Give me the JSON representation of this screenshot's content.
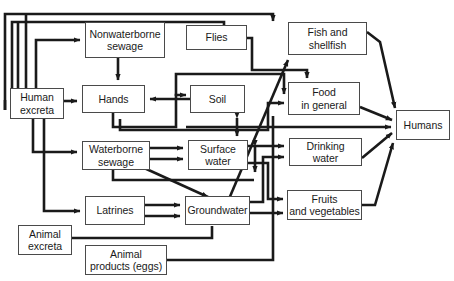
{
  "diagram": {
    "type": "flow-diagram",
    "stroke_color": "#1a1a1a",
    "box_border_color": "#4a4a4a",
    "background_color": "#ffffff",
    "nodes": [
      {
        "id": "human-excreta",
        "label": "Human\nexcreta",
        "x": 10,
        "y": 88,
        "w": 54,
        "h": 31
      },
      {
        "id": "nonwaterborne",
        "label": "Nonwaterborne\nsewage",
        "x": 85,
        "y": 22,
        "w": 80,
        "h": 36
      },
      {
        "id": "flies",
        "label": "Flies",
        "x": 186,
        "y": 25,
        "w": 61,
        "h": 25
      },
      {
        "id": "fish-shellfish",
        "label": "Fish and\nshellfish",
        "x": 288,
        "y": 22,
        "w": 79,
        "h": 33
      },
      {
        "id": "hands",
        "label": "Hands",
        "x": 82,
        "y": 85,
        "w": 63,
        "h": 28
      },
      {
        "id": "soil",
        "label": "Soil",
        "x": 190,
        "y": 85,
        "w": 55,
        "h": 28
      },
      {
        "id": "food-in-general",
        "label": "Food\nin general",
        "x": 288,
        "y": 82,
        "w": 72,
        "h": 33
      },
      {
        "id": "humans",
        "label": "Humans",
        "x": 396,
        "y": 110,
        "w": 54,
        "h": 30
      },
      {
        "id": "waterborne",
        "label": "Waterborne\nsewage",
        "x": 82,
        "y": 141,
        "w": 68,
        "h": 29
      },
      {
        "id": "surface-water",
        "label": "Surface\nwater",
        "x": 188,
        "y": 140,
        "w": 60,
        "h": 30
      },
      {
        "id": "drinking-water",
        "label": "Drinking\nwater",
        "x": 289,
        "y": 138,
        "w": 73,
        "h": 28
      },
      {
        "id": "latrines",
        "label": "Latrines",
        "x": 85,
        "y": 196,
        "w": 60,
        "h": 29
      },
      {
        "id": "groundwater",
        "label": "Groundwater",
        "x": 185,
        "y": 196,
        "w": 65,
        "h": 29
      },
      {
        "id": "fruits-vegetables",
        "label": "Fruits\nand vegetables",
        "x": 287,
        "y": 190,
        "w": 75,
        "h": 30
      },
      {
        "id": "animal-excreta",
        "label": "Animal\nexcreta",
        "x": 18,
        "y": 225,
        "w": 54,
        "h": 30
      },
      {
        "id": "animal-products",
        "label": "Animal\nproducts (eggs)",
        "x": 85,
        "y": 245,
        "w": 82,
        "h": 30
      }
    ],
    "edges": [
      {
        "id": "e-humans-to-humanexcreta-outer",
        "from": "humans",
        "to": "human-excreta",
        "label": ""
      },
      {
        "id": "e-humans-to-humanexcreta-inner",
        "from": "humans",
        "to": "human-excreta",
        "label": ""
      },
      {
        "id": "e-humanexcreta-nonwaterborne",
        "from": "human-excreta",
        "to": "nonwaterborne",
        "label": ""
      },
      {
        "id": "e-humanexcreta-hands",
        "from": "human-excreta",
        "to": "hands",
        "label": ""
      },
      {
        "id": "e-humanexcreta-waterborne",
        "from": "human-excreta",
        "to": "waterborne",
        "label": ""
      },
      {
        "id": "e-humanexcreta-latrines",
        "from": "human-excreta",
        "to": "latrines",
        "label": ""
      },
      {
        "id": "e-nonwaterborne-hands",
        "from": "nonwaterborne",
        "to": "hands",
        "label": ""
      },
      {
        "id": "e-nonwaterborne-flies",
        "from": "nonwaterborne",
        "to": "flies",
        "label": ""
      },
      {
        "id": "e-flies-food",
        "from": "flies",
        "to": "food-in-general",
        "label": ""
      },
      {
        "id": "e-soil-hands",
        "from": "soil",
        "to": "hands",
        "label": ""
      },
      {
        "id": "e-hands-soil",
        "from": "hands",
        "to": "soil",
        "label": ""
      },
      {
        "id": "e-hands-food",
        "from": "hands",
        "to": "food-in-general",
        "label": ""
      },
      {
        "id": "e-soil-surface",
        "from": "soil",
        "to": "surface-water",
        "label": ""
      },
      {
        "id": "e-surface-soil",
        "from": "surface-water",
        "to": "soil",
        "label": ""
      },
      {
        "id": "e-surface-groundwater",
        "from": "surface-water",
        "to": "groundwater",
        "label": ""
      },
      {
        "id": "e-groundwater-surface",
        "from": "groundwater",
        "to": "surface-water",
        "label": ""
      },
      {
        "id": "e-waterborne-surface",
        "from": "waterborne",
        "to": "surface-water",
        "label": ""
      },
      {
        "id": "e-waterborne-groundwater",
        "from": "waterborne",
        "to": "groundwater",
        "label": ""
      },
      {
        "id": "e-latrines-groundwater",
        "from": "latrines",
        "to": "groundwater",
        "label": ""
      },
      {
        "id": "e-surface-fish",
        "from": "surface-water",
        "to": "fish-shellfish",
        "label": ""
      },
      {
        "id": "e-surface-drinking",
        "from": "surface-water",
        "to": "drinking-water",
        "label": ""
      },
      {
        "id": "e-groundwater-drinking",
        "from": "groundwater",
        "to": "drinking-water",
        "label": ""
      },
      {
        "id": "e-surface-fruits",
        "from": "surface-water",
        "to": "fruits-vegetables",
        "label": ""
      },
      {
        "id": "e-groundwater-fruits",
        "from": "groundwater",
        "to": "fruits-vegetables",
        "label": ""
      },
      {
        "id": "e-fish-humans",
        "from": "fish-shellfish",
        "to": "humans",
        "label": ""
      },
      {
        "id": "e-food-humans",
        "from": "food-in-general",
        "to": "humans",
        "label": ""
      },
      {
        "id": "e-drinking-humans",
        "from": "drinking-water",
        "to": "humans",
        "label": ""
      },
      {
        "id": "e-fruits-humans",
        "from": "fruits-vegetables",
        "to": "humans",
        "label": ""
      },
      {
        "id": "e-animalexcreta-soilpath",
        "from": "animal-excreta",
        "to": "groundwater",
        "label": ""
      },
      {
        "id": "e-animalproducts-food",
        "from": "animal-products",
        "to": "food-in-general",
        "label": ""
      }
    ]
  }
}
